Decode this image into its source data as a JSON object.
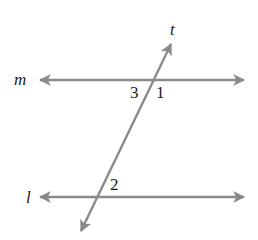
{
  "diagram": {
    "type": "parallel-lines-transversal",
    "colors": {
      "line": "#8a8a8a",
      "text": "#1a1a1a",
      "background": "#ffffff"
    },
    "lines": {
      "m": {
        "label": "m",
        "description": "upper horizontal line with arrows at both ends"
      },
      "l": {
        "label": "l",
        "description": "lower horizontal line with arrows at both ends"
      },
      "t": {
        "label": "t",
        "description": "transversal line crossing m and l, arrows at both ends"
      }
    },
    "angles": [
      {
        "id": "angle-3",
        "label": "3",
        "position": "below m, left of t"
      },
      {
        "id": "angle-1",
        "label": "1",
        "position": "below m, right of t"
      },
      {
        "id": "angle-2",
        "label": "2",
        "position": "above l, right of t"
      }
    ]
  }
}
